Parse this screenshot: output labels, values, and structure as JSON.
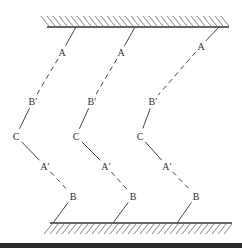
{
  "diagram": {
    "top_wall": {
      "x1": 47,
      "x2": 229,
      "y": 27,
      "hatch_direction": "up-left"
    },
    "bottom_wall": {
      "x1": 50,
      "x2": 232,
      "y": 223,
      "hatch_direction": "down-left"
    },
    "chains": [
      {
        "id": "chain-1",
        "top_anchor": [
          76,
          27
        ],
        "points": {
          "A": [
            62,
            52
          ],
          "B_prime": [
            33,
            101
          ],
          "C": [
            16,
            136
          ],
          "A_prime": [
            45,
            166
          ],
          "B": [
            73,
            196
          ]
        },
        "bottom_anchor": [
          53,
          223
        ],
        "labels": {
          "A": "A",
          "B_prime": "B′",
          "C": "C",
          "A_prime": "A′",
          "B": "B"
        }
      },
      {
        "id": "chain-2",
        "top_anchor": [
          135,
          27
        ],
        "points": {
          "A": [
            121,
            52
          ],
          "B_prime": [
            92,
            101
          ],
          "C": [
            76,
            136
          ],
          "A_prime": [
            106,
            166
          ],
          "B": [
            133,
            196
          ]
        },
        "bottom_anchor": [
          113,
          223
        ],
        "labels": {
          "A": "A",
          "B_prime": "B′",
          "C": "C",
          "A_prime": "A′",
          "B": "B"
        }
      },
      {
        "id": "chain-3",
        "top_anchor": [
          219,
          27
        ],
        "points": {
          "A": [
            201,
            46
          ],
          "B_prime": [
            153,
            101
          ],
          "C": [
            140,
            136
          ],
          "A_prime": [
            167,
            166
          ],
          "B": [
            196,
            196
          ]
        },
        "bottom_anchor": [
          177,
          223
        ],
        "labels": {
          "A": "A",
          "B_prime": "B′",
          "C": "C",
          "A_prime": "A′",
          "B": "B"
        }
      }
    ],
    "colors": {
      "line": "#444444",
      "hatch": "#666666",
      "label": "#333333",
      "bottom_bar": "#2a2a2a"
    }
  }
}
